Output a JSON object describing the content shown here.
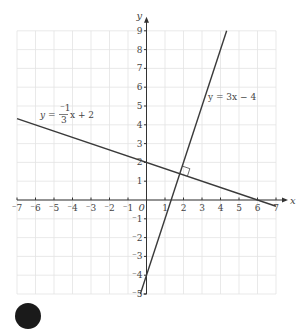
{
  "chart_data": {
    "type": "line",
    "title": "",
    "xlabel": "x",
    "ylabel": "y",
    "xlim": [
      -7,
      7
    ],
    "ylim": [
      -5,
      9
    ],
    "grid": true,
    "origin_label": "0",
    "x_ticks": [
      -7,
      -6,
      -5,
      -4,
      -3,
      -2,
      -1,
      1,
      2,
      3,
      4,
      5,
      6,
      7
    ],
    "x_tick_labels": [
      "⁻7",
      "⁻6",
      "⁻5",
      "⁻4",
      "⁻3",
      "⁻2",
      "⁻1",
      "1",
      "2",
      "3",
      "4",
      "5",
      "6",
      "7"
    ],
    "y_ticks": [
      -5,
      -4,
      -3,
      -2,
      -1,
      1,
      2,
      3,
      4,
      5,
      6,
      7,
      8,
      9
    ],
    "y_tick_labels": [
      "⁻5",
      "⁻4",
      "⁻3",
      "⁻2",
      "⁻1",
      "1",
      "2",
      "3",
      "4",
      "5",
      "6",
      "7",
      "8",
      "9"
    ],
    "series": [
      {
        "name": "y = -1/3 x + 2",
        "slope": -0.3333,
        "intercept": 2,
        "points": [
          [
            -7,
            4.333
          ],
          [
            0,
            2
          ],
          [
            6,
            0
          ],
          [
            7,
            -0.333
          ]
        ]
      },
      {
        "name": "y = 3x - 4",
        "slope": 3,
        "intercept": -4,
        "points": [
          [
            -0.333,
            -5
          ],
          [
            0,
            -4
          ],
          [
            1.333,
            0
          ],
          [
            4.333,
            9
          ]
        ]
      }
    ],
    "annotations": [
      {
        "type": "label",
        "text": "y = ⁻1/3 x + 2",
        "at": [
          -5.5,
          4.3
        ]
      },
      {
        "type": "label",
        "text": "y = 3x − 4",
        "at": [
          3.4,
          5.0
        ]
      },
      {
        "type": "right-angle-marker",
        "at": [
          1.8,
          1.4
        ]
      }
    ]
  },
  "labels": {
    "x_axis": "x",
    "y_axis": "y",
    "origin": "0",
    "eq1_prefix": "y = ",
    "eq1_num": "⁻1",
    "eq1_den": "3",
    "eq1_suffix": "x + 2",
    "eq2": "y = 3x − 4"
  }
}
